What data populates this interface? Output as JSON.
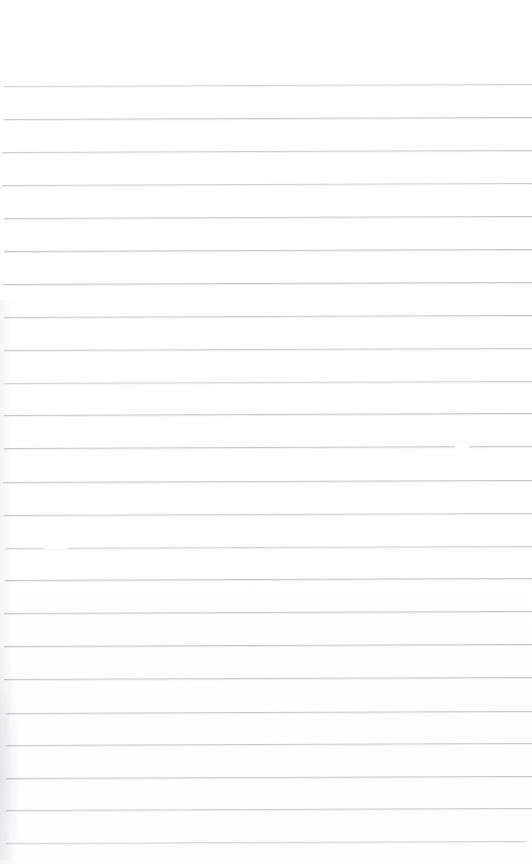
{
  "document": {
    "kind": "scanned-ruled-paper",
    "title": "Blank lined notebook page",
    "width_px": 532,
    "height_px": 864,
    "background_color": "#ffffff",
    "rule_color": "#b9b9bd",
    "text_content": "",
    "visible_text": [],
    "top_margin_px": 86,
    "rule_spacing_px": 33,
    "rule_count": 24,
    "slope_deg": -0.22,
    "notes": "No text, headings, numbers or labels are present on the page."
  },
  "rules": [
    {
      "y": 86,
      "x": 4,
      "w": 528,
      "opacity": 0.62
    },
    {
      "y": 119,
      "x": 4,
      "w": 528,
      "opacity": 0.78
    },
    {
      "y": 152,
      "x": 2,
      "w": 530,
      "opacity": 0.7
    },
    {
      "y": 185,
      "x": 2,
      "w": 530,
      "opacity": 0.66
    },
    {
      "y": 218,
      "x": 4,
      "w": 528,
      "opacity": 0.76
    },
    {
      "y": 251,
      "x": 4,
      "w": 528,
      "opacity": 0.8
    },
    {
      "y": 284,
      "x": 3,
      "w": 529,
      "opacity": 0.82
    },
    {
      "y": 317,
      "x": 4,
      "w": 528,
      "opacity": 0.74
    },
    {
      "y": 350,
      "x": 4,
      "w": 528,
      "opacity": 0.72
    },
    {
      "y": 383,
      "x": 4,
      "w": 528,
      "opacity": 0.62
    },
    {
      "y": 415,
      "x": 4,
      "w": 528,
      "opacity": 0.8
    },
    {
      "y": 448,
      "x": 4,
      "w": 528,
      "opacity": 0.78
    },
    {
      "y": 482,
      "x": 3,
      "w": 529,
      "opacity": 0.76
    },
    {
      "y": 515,
      "x": 4,
      "w": 528,
      "opacity": 0.7
    },
    {
      "y": 548,
      "x": 4,
      "w": 528,
      "opacity": 0.62
    },
    {
      "y": 580,
      "x": 5,
      "w": 527,
      "opacity": 0.8
    },
    {
      "y": 613,
      "x": 4,
      "w": 528,
      "opacity": 0.78
    },
    {
      "y": 646,
      "x": 4,
      "w": 528,
      "opacity": 0.8
    },
    {
      "y": 679,
      "x": 4,
      "w": 528,
      "opacity": 0.76
    },
    {
      "y": 713,
      "x": 6,
      "w": 526,
      "opacity": 0.74
    },
    {
      "y": 745,
      "x": 6,
      "w": 526,
      "opacity": 0.72
    },
    {
      "y": 778,
      "x": 6,
      "w": 526,
      "opacity": 0.74
    },
    {
      "y": 810,
      "x": 6,
      "w": 526,
      "opacity": 0.7
    },
    {
      "y": 843,
      "x": 6,
      "w": 520,
      "opacity": 0.6
    }
  ],
  "dropouts": [
    {
      "x": 455,
      "y": 447,
      "w": 14
    },
    {
      "x": 44,
      "y": 547,
      "w": 24
    },
    {
      "x": 0,
      "y": 547,
      "w": 6
    }
  ]
}
